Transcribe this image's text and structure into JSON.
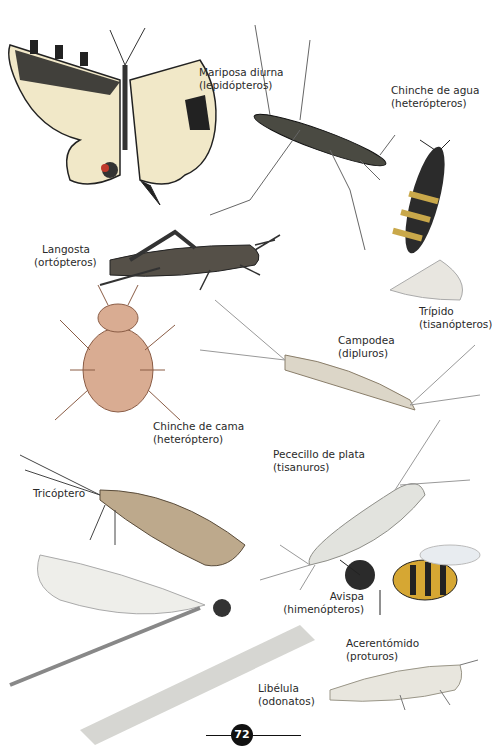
{
  "page": {
    "number": "72",
    "background": "#ffffff",
    "ink_color": "#111111"
  },
  "insects": [
    {
      "id": "mariposa",
      "name": "Mariposa diurna",
      "order": "(lepidópteros)",
      "icon": "butterfly-icon"
    },
    {
      "id": "chinche-agua",
      "name": "Chinche de agua",
      "order": "(heterópteros)",
      "icon": "water-bug-icon"
    },
    {
      "id": "trips",
      "name": "Trípido",
      "order": "(tisanópteros)",
      "icon": "thrips-icon"
    },
    {
      "id": "langosta",
      "name": "Langosta",
      "order": "(ortópteros)",
      "icon": "grasshopper-icon"
    },
    {
      "id": "campodea",
      "name": "Campodea",
      "order": "(dipluros)",
      "icon": "campodea-icon"
    },
    {
      "id": "chinche-cama",
      "name": "Chinche de cama",
      "order": "(heteróptero)",
      "icon": "bedbug-icon"
    },
    {
      "id": "pececillo",
      "name": "Pececillo de plata",
      "order": "(tisanuros)",
      "icon": "silverfish-icon"
    },
    {
      "id": "tricoptero",
      "name": "Tricóptero",
      "order": "",
      "icon": "caddisfly-icon"
    },
    {
      "id": "avispa",
      "name": "Avispa",
      "order": "(himenópteros)",
      "icon": "wasp-icon"
    },
    {
      "id": "acerentomido",
      "name": "Acerentómido",
      "order": "(proturos)",
      "icon": "proturan-icon"
    },
    {
      "id": "libelula",
      "name": "Libélula",
      "order": "(odonatos)",
      "icon": "dragonfly-icon"
    }
  ]
}
